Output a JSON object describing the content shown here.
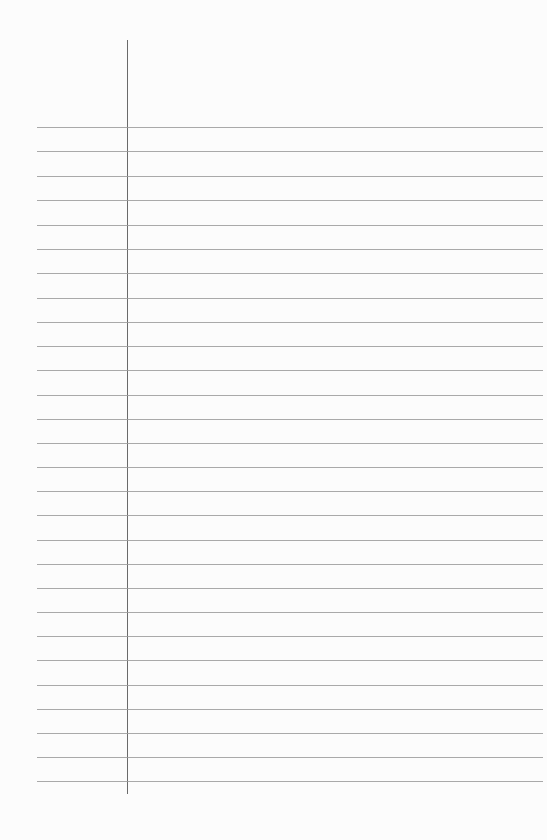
{
  "page": {
    "type": "lined-paper",
    "background_color": "#fcfcfc",
    "rule_color": "#9a9a9a",
    "margin_color": "#6a6a6a"
  },
  "margin_line": {
    "x": 127,
    "y_start": 40,
    "y_end": 794
  },
  "rules": {
    "x_start": 37,
    "x_end": 543,
    "y_positions": [
      127,
      151,
      176,
      200,
      225,
      249,
      273,
      298,
      322,
      346,
      370,
      395,
      419,
      443,
      467,
      491,
      515,
      540,
      564,
      588,
      612,
      636,
      660,
      685,
      709,
      733,
      757,
      781
    ]
  }
}
